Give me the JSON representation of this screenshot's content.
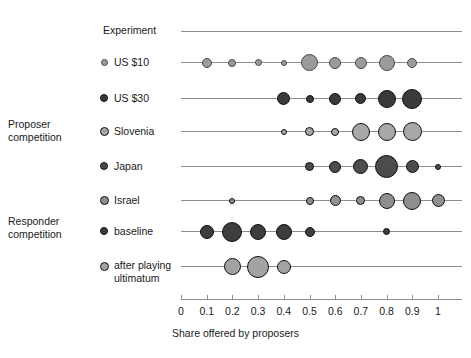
{
  "chart_data": {
    "type": "scatter",
    "title": "",
    "header_label": "Experiment",
    "xlabel": "Share offered by proposers",
    "ylabel": "",
    "xlim": [
      0,
      1.08
    ],
    "xticks": [
      0,
      0.1,
      0.2,
      0.3,
      0.4,
      0.5,
      0.6,
      0.7,
      0.8,
      0.9,
      1
    ],
    "xtick_labels": [
      "0",
      "0.1",
      "0.2",
      "0.3",
      "0.4",
      "0.5",
      "0.6",
      "0.7",
      "0.8",
      "0.9",
      "1"
    ],
    "grid": false,
    "legend_position": "left-axis-labels",
    "note": "Bubble size encodes relative frequency of each offer share within an experiment",
    "groups": [
      {
        "name": "Proposer competition",
        "label": "Proposer\ncompetition",
        "rows": [
          "US $10",
          "US $30",
          "Slovenia",
          "Japan",
          "Israel"
        ]
      },
      {
        "name": "Responder competition",
        "label": "Responder\ncompetition",
        "rows": [
          "baseline",
          "after playing ultimatum"
        ]
      }
    ],
    "series": [
      {
        "name": "US $10",
        "label": "US $10",
        "marker_fill": "#9b9b9b",
        "marker_stroke": "#4a4a4a",
        "legend_size": 7,
        "x": [
          0.1,
          0.2,
          0.3,
          0.4,
          0.5,
          0.6,
          0.7,
          0.8,
          0.9
        ],
        "sizes": [
          10,
          8,
          7,
          6,
          17,
          12,
          12,
          16,
          10
        ]
      },
      {
        "name": "US $30",
        "label": "US $30",
        "marker_fill": "#3a3a3a",
        "marker_stroke": "#111111",
        "legend_size": 8,
        "x": [
          0.4,
          0.5,
          0.6,
          0.7,
          0.8,
          0.9
        ],
        "sizes": [
          13,
          8,
          12,
          11,
          18,
          20
        ]
      },
      {
        "name": "Slovenia",
        "label": "Slovenia",
        "marker_fill": "#a8a8a8",
        "marker_stroke": "#111111",
        "legend_size": 9,
        "x": [
          0.4,
          0.5,
          0.6,
          0.7,
          0.8,
          0.9
        ],
        "sizes": [
          6,
          9,
          8,
          18,
          18,
          19
        ]
      },
      {
        "name": "Japan",
        "label": "Japan",
        "marker_fill": "#4c4c4c",
        "marker_stroke": "#111111",
        "legend_size": 8,
        "x": [
          0.5,
          0.6,
          0.7,
          0.8,
          0.9,
          1.0
        ],
        "sizes": [
          9,
          12,
          15,
          23,
          13,
          6
        ]
      },
      {
        "name": "Israel",
        "label": "Israel",
        "marker_fill": "#8f8f8f",
        "marker_stroke": "#111111",
        "legend_size": 9,
        "x": [
          0.2,
          0.5,
          0.6,
          0.7,
          0.8,
          0.9,
          1.0
        ],
        "sizes": [
          6,
          8,
          11,
          9,
          16,
          18,
          13
        ]
      },
      {
        "name": "baseline",
        "label": "baseline",
        "marker_fill": "#3d3d3d",
        "marker_stroke": "#111111",
        "legend_size": 8,
        "x": [
          0.1,
          0.2,
          0.3,
          0.4,
          0.5,
          0.8
        ],
        "sizes": [
          14,
          20,
          16,
          16,
          10,
          7
        ]
      },
      {
        "name": "after playing ultimatum",
        "label": "after playing\nultimatum",
        "marker_fill": "#a3a3a3",
        "marker_stroke": "#111111",
        "legend_size": 9,
        "x": [
          0.2,
          0.3,
          0.4
        ],
        "sizes": [
          17,
          22,
          14
        ]
      }
    ]
  },
  "colors": {
    "axis": "#8d8d8d",
    "text": "#1a1a1a",
    "background": "#ffffff"
  }
}
